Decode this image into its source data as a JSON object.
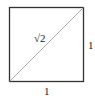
{
  "diagram": {
    "shape": "unit square with diagonal",
    "diagonal_label": "√2",
    "side_right_label": "1",
    "side_bottom_label": "1",
    "colors": {
      "square_stroke": "#333333",
      "diagonal_stroke": "#aaaaaa",
      "text": "#222222"
    }
  }
}
